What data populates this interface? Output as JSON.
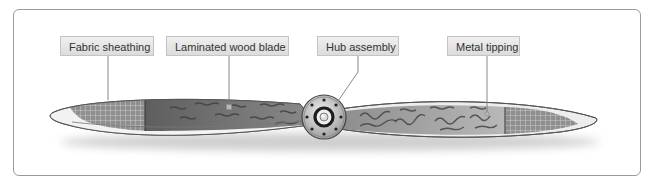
{
  "diagram": {
    "labels": [
      {
        "id": "fabric",
        "text": "Fabric sheathing"
      },
      {
        "id": "laminated",
        "text": "Laminated wood blade"
      },
      {
        "id": "hub",
        "text": "Hub assembly"
      },
      {
        "id": "metal",
        "text": "Metal tipping"
      }
    ],
    "colors": {
      "frame_border": "#9a9a9a",
      "label_bg": "#e4e4e4",
      "label_border": "#c4c4c4",
      "wood_dark": "#6e6e6e",
      "wood_light": "#b5b5b5",
      "fabric": "#9a9a9a",
      "tip_edge": "#e8e8e8"
    }
  }
}
